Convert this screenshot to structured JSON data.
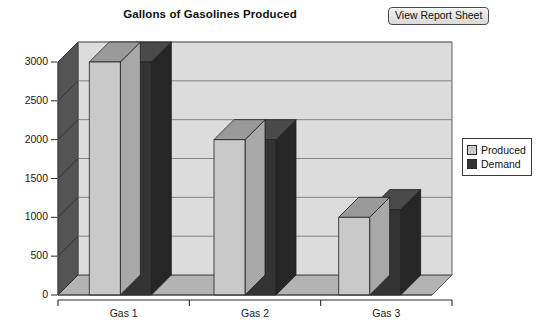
{
  "header": {
    "title": "Gallons of Gasolines Produced",
    "button_label": "View Report Sheet"
  },
  "legend": {
    "items": [
      {
        "label": "Produced",
        "color": "#c9c9c9"
      },
      {
        "label": "Demand",
        "color": "#333333"
      }
    ]
  },
  "colors": {
    "produced": "#c9c9c9",
    "produced_top": "#9a9a9a",
    "produced_side": "#a8a8a8",
    "demand": "#333333",
    "demand_top": "#4a4a4a",
    "demand_side": "#262626",
    "plot_background": "#d6d6d6",
    "back_wall": "#dcdcdc",
    "left_wall": "#545454",
    "floor": "#b3b3b3",
    "gridline": "#7a7a7a",
    "axis": "#3c3c3c"
  },
  "chart_data": {
    "type": "bar",
    "title": "Gallons of Gasolines Produced",
    "xlabel": "",
    "ylabel": "",
    "categories": [
      "Gas 1",
      "Gas 2",
      "Gas 3"
    ],
    "series": [
      {
        "name": "Produced",
        "values": [
          3000,
          2000,
          1000
        ]
      },
      {
        "name": "Demand",
        "values": [
          3000,
          2000,
          1100
        ]
      }
    ],
    "ylim": [
      0,
      3000
    ],
    "yticks": [
      0,
      500,
      1000,
      1500,
      2000,
      2500,
      3000
    ],
    "ytick_labels": [
      "0",
      "500",
      "1000",
      "1500",
      "2000",
      "2500",
      "3000"
    ],
    "grid": true,
    "grid_axis": "y",
    "legend_position": "right",
    "three_d": true
  }
}
